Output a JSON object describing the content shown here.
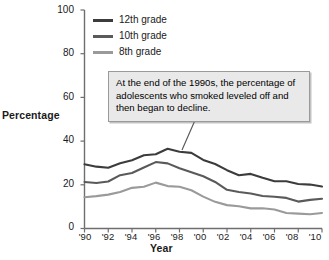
{
  "chart_data": {
    "type": "line",
    "title": "",
    "xlabel": "Year",
    "ylabel": "Percentage",
    "xlim": [
      1990,
      2010
    ],
    "ylim": [
      0,
      100
    ],
    "grid": false,
    "legend_position": "top-left-inside",
    "x": [
      1990,
      1991,
      1992,
      1993,
      1994,
      1995,
      1996,
      1997,
      1998,
      1999,
      2000,
      2001,
      2002,
      2003,
      2004,
      2005,
      2006,
      2007,
      2008,
      2009,
      2010
    ],
    "xtick_labels": [
      "'90",
      "'92",
      "'94",
      "'96",
      "'98",
      "'00",
      "'02",
      "'04",
      "'06",
      "'08",
      "'10"
    ],
    "xtick_values": [
      1990,
      1992,
      1994,
      1996,
      1998,
      2000,
      2002,
      2004,
      2006,
      2008,
      2010
    ],
    "ytick_labels": [
      "0",
      "20",
      "40",
      "60",
      "80",
      "100"
    ],
    "ytick_values": [
      0,
      20,
      40,
      60,
      80,
      100
    ],
    "series": [
      {
        "name": "12th grade",
        "color": "#3c3c3c",
        "values": [
          29.4,
          28.3,
          27.8,
          29.9,
          31.2,
          33.5,
          34.0,
          36.5,
          35.1,
          34.6,
          31.4,
          29.5,
          26.7,
          24.4,
          25.0,
          23.2,
          21.6,
          21.6,
          20.4,
          20.1,
          19.2
        ]
      },
      {
        "name": "10th grade",
        "color": "#5a5a5a",
        "values": [
          21.3,
          20.8,
          21.5,
          24.4,
          25.4,
          27.9,
          30.4,
          29.8,
          27.6,
          25.7,
          23.9,
          21.3,
          17.7,
          16.7,
          16.0,
          14.9,
          14.5,
          14.0,
          12.3,
          13.1,
          13.6
        ]
      },
      {
        "name": "8th grade",
        "color": "#9a9a9a",
        "values": [
          14.3,
          14.8,
          15.5,
          16.7,
          18.6,
          19.1,
          21.0,
          19.4,
          19.1,
          17.5,
          14.6,
          12.2,
          10.7,
          10.2,
          9.2,
          9.3,
          8.7,
          7.1,
          6.8,
          6.5,
          7.1
        ]
      }
    ],
    "annotations": [
      {
        "text": "At the end of the 1990s, the percentage of adolescents who smoked leveled off and then began to decline.",
        "points_to_year": 1997,
        "points_to_value": 36
      }
    ]
  },
  "axes": {
    "y_title": "Percentage",
    "x_title": "Year"
  }
}
